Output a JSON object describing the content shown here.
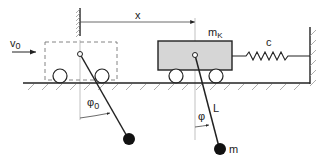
{
  "diagram": {
    "labels": {
      "displacement": "x",
      "initial_velocity": "v",
      "initial_velocity_sub": "0",
      "cart_mass": "m",
      "cart_mass_sub": "K",
      "spring_constant": "c",
      "pendulum_length": "L",
      "pendulum_mass": "m",
      "initial_angle": "φ",
      "initial_angle_sub": "0",
      "angle": "φ"
    },
    "colors": {
      "line": "#222222",
      "cart_fill": "#d6d6d6",
      "dashed": "#777777",
      "hatch": "#888888"
    }
  }
}
